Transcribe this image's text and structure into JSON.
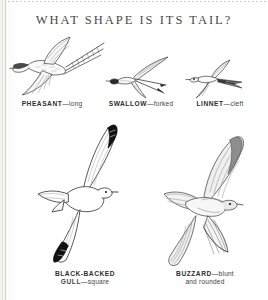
{
  "page": {
    "title": "WHAT SHAPE IS ITS TAIL?",
    "background_color": "#fdfdfb",
    "ink_color": "#2e2e2e",
    "title_color": "#4a4a4a"
  },
  "figures": [
    {
      "id": "pheasant",
      "bird": "PHEASANT",
      "dash": "—",
      "tail_shape": "long",
      "caption_line2": "",
      "row": "top",
      "icon": "pheasant-in-flight-icon"
    },
    {
      "id": "swallow",
      "bird": "SWALLOW",
      "dash": "—",
      "tail_shape": "forked",
      "caption_line2": "",
      "row": "top",
      "icon": "swallow-in-flight-icon"
    },
    {
      "id": "linnet",
      "bird": "LINNET",
      "dash": "—",
      "tail_shape": "cleft",
      "caption_line2": "",
      "row": "top",
      "icon": "linnet-in-flight-icon"
    },
    {
      "id": "gull",
      "bird": "BLACK-BACKED",
      "bird_line2": "GULL",
      "dash": "—",
      "tail_shape": "square",
      "caption_line2": "",
      "row": "bottom",
      "icon": "black-backed-gull-in-flight-icon"
    },
    {
      "id": "buzzard",
      "bird": "BUZZARD",
      "dash": "—",
      "tail_shape": "blunt",
      "caption_line2": "and rounded",
      "row": "bottom",
      "icon": "buzzard-in-flight-icon"
    }
  ]
}
